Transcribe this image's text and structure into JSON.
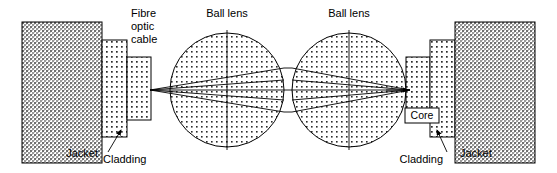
{
  "figure": {
    "width": 557,
    "height": 173,
    "background": "#ffffff",
    "line_color": "#000000",
    "text_color": "#000000"
  },
  "labels": {
    "fibre_optic_cable_line1": "Fibre",
    "fibre_optic_cable_line2": "optic",
    "fibre_optic_cable_line3": "cable",
    "ball_lens_left": "Ball lens",
    "ball_lens_right": "Ball lens",
    "jacket_left": "Jacket",
    "cladding_left": "Cladding",
    "core_right": "Core",
    "cladding_right": "Cladding",
    "jacket_right": "Jacket"
  },
  "components": {
    "left_jacket": {
      "name": "Jacket",
      "x": 22,
      "y": 22,
      "w": 80,
      "h": 141,
      "fill": "jacket-stipple"
    },
    "left_cladding": {
      "name": "Cladding",
      "x": 102,
      "y": 40,
      "w": 25,
      "h": 97,
      "fill": "cladding-dots"
    },
    "left_core": {
      "name": "Core",
      "x": 127,
      "y": 57,
      "w": 24,
      "h": 63,
      "fill": "cladding-dots"
    },
    "ball_lens_left": {
      "name": "Ball lens",
      "cx": 227,
      "cy": 90,
      "r": 57,
      "fill": "lens-dots"
    },
    "ball_lens_right": {
      "name": "Ball lens",
      "cx": 349,
      "cy": 90,
      "r": 57,
      "fill": "lens-dots"
    },
    "right_core": {
      "name": "Core",
      "x": 406,
      "y": 57,
      "w": 24,
      "h": 63,
      "fill": "cladding-dots"
    },
    "right_cladding": {
      "name": "Cladding",
      "x": 430,
      "y": 40,
      "w": 25,
      "h": 97,
      "fill": "cladding-dots"
    },
    "right_jacket": {
      "name": "Jacket",
      "x": 455,
      "y": 22,
      "w": 80,
      "h": 141,
      "fill": "jacket-stipple"
    }
  },
  "optics": {
    "focal_point_left": {
      "x": 150,
      "y": 90
    },
    "focal_point_right": {
      "x": 410,
      "y": 90
    },
    "axis_y": 90,
    "ray_spread_y_top": 72,
    "ray_spread_y_bottom": 108,
    "collimated_top_y": 68,
    "collimated_bottom_y": 112
  },
  "leader_lines": {
    "ball_lens_left": {
      "x": 227,
      "y1": 30,
      "y2": 150
    },
    "ball_lens_right": {
      "x": 349,
      "y1": 30,
      "y2": 150
    },
    "cladding_left_arrow": {
      "x1": 108,
      "y1": 152,
      "x2": 121,
      "y2": 130
    },
    "cladding_right_arrow": {
      "x1": 446,
      "y1": 152,
      "x2": 436,
      "y2": 130
    }
  }
}
